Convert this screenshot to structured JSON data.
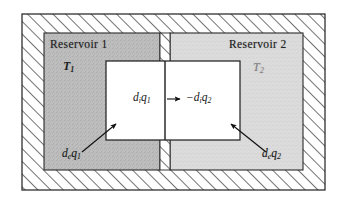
{
  "figure": {
    "colors": {
      "hatch_line": "#2b2b2b",
      "outer_border": "#1f1f1f",
      "reservoir1_fill": "#bdbdbd",
      "reservoir2_fill": "#d8d8d8",
      "inner_box_fill": "#ffffff",
      "text": "#1a1a1a",
      "arrow": "#111111"
    },
    "reservoir1": {
      "title": "Reservoir 1",
      "temperature": "T",
      "temperature_sub": "1",
      "external_flux": "d",
      "external_flux_sub": "e",
      "external_flux_q": "q",
      "external_flux_q_sub": "1"
    },
    "reservoir2": {
      "title": "Reservoir 2",
      "temperature": "T",
      "temperature_sub": "2",
      "external_flux": "d",
      "external_flux_sub": "e",
      "external_flux_q": "q",
      "external_flux_q_sub": "2"
    },
    "internal": {
      "left_term": "d",
      "left_term_sub": "i",
      "left_q": "q",
      "left_q_sub": "1",
      "arrow_glyph": "⟶",
      "right_term": "−d",
      "right_term_sub": "i",
      "right_q": "q",
      "right_q_sub": "2"
    },
    "annotations": {
      "arrow_left_name": "external-heat-arrow-left",
      "arrow_right_name": "external-heat-arrow-right",
      "arrow_center_name": "internal-heat-arrow"
    }
  }
}
